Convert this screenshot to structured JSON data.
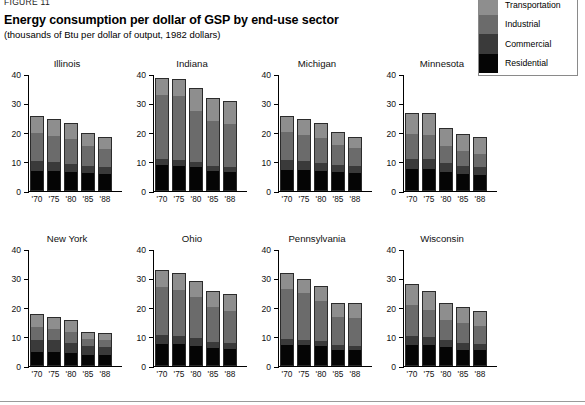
{
  "figure_label": "FIGURE 11",
  "title": "Energy consumption per dollar of GSP by end-use sector",
  "subtitle": "(thousands of Btu per dollar of output, 1982 dollars)",
  "legend": {
    "items": [
      {
        "label": "Transportation",
        "color": "#8e8e8e"
      },
      {
        "label": "Industrial",
        "color": "#6b6b6b"
      },
      {
        "label": "Commercial",
        "color": "#3a3a3a"
      },
      {
        "label": "Residential",
        "color": "#050505"
      }
    ]
  },
  "axis": {
    "yticks": [
      0,
      10,
      20,
      30,
      40
    ],
    "ymax": 40,
    "xlabels": [
      "'70",
      "'75",
      "'80",
      "'85",
      "'88"
    ]
  },
  "chart_data": {
    "type": "bar",
    "subtype": "stacked-bar-small-multiples",
    "title": "Energy consumption per dollar of GSP by end-use sector",
    "subtitle": "(thousands of Btu per dollar of output, 1982 dollars)",
    "xlabel": "",
    "ylabel": "thousands of Btu per dollar of output, 1982 dollars",
    "ylim": [
      0,
      40
    ],
    "grid": false,
    "legend_position": "top-right",
    "categories": [
      "'70",
      "'75",
      "'80",
      "'85",
      "'88"
    ],
    "series_names": [
      "Residential",
      "Commercial",
      "Industrial",
      "Transportation"
    ],
    "panels": [
      {
        "name": "Illinois",
        "series": [
          {
            "name": "Residential",
            "values": [
              6.5,
              6.4,
              6.2,
              5.7,
              5.5
            ]
          },
          {
            "name": "Commercial",
            "values": [
              3.3,
              3.1,
              2.8,
              2.5,
              2.3
            ]
          },
          {
            "name": "Industrial",
            "values": [
              9.8,
              9.1,
              8.4,
              6.8,
              6.2
            ]
          },
          {
            "name": "Transportation",
            "values": [
              5.4,
              5.4,
              5.1,
              4.2,
              3.8
            ]
          }
        ],
        "totals": [
          25.0,
          24.0,
          22.5,
          19.2,
          17.8
        ]
      },
      {
        "name": "Indiana",
        "series": [
          {
            "name": "Residential",
            "values": [
              8.5,
              8.3,
              7.8,
              6.5,
              6.3
            ]
          },
          {
            "name": "Commercial",
            "values": [
              2.2,
              2.1,
              1.8,
              1.6,
              1.6
            ]
          },
          {
            "name": "Industrial",
            "values": [
              21.8,
              21.6,
              17.4,
              15.4,
              14.6
            ]
          },
          {
            "name": "Transportation",
            "values": [
              5.5,
              5.5,
              7.5,
              7.5,
              7.5
            ]
          }
        ],
        "totals": [
          38.0,
          37.5,
          34.5,
          31.0,
          30.0
        ]
      },
      {
        "name": "Michigan",
        "series": [
          {
            "name": "Residential",
            "values": [
              7.0,
              6.9,
              6.6,
              6.0,
              5.8
            ]
          },
          {
            "name": "Commercial",
            "values": [
              3.2,
              3.0,
              2.7,
              2.4,
              2.3
            ]
          },
          {
            "name": "Industrial",
            "values": [
              9.6,
              9.0,
              8.4,
              7.0,
              6.2
            ]
          },
          {
            "name": "Transportation",
            "values": [
              5.2,
              5.1,
              5.0,
              4.0,
              3.6
            ]
          }
        ],
        "totals": [
          25.0,
          24.0,
          22.7,
          19.4,
          17.9
        ]
      },
      {
        "name": "Minnesota",
        "series": [
          {
            "name": "Residential",
            "values": [
              7.3,
              7.2,
              6.3,
              5.6,
              5.3
            ]
          },
          {
            "name": "Commercial",
            "values": [
              3.4,
              3.3,
              2.9,
              2.6,
              2.4
            ]
          },
          {
            "name": "Industrial",
            "values": [
              8.4,
              8.4,
              5.8,
              5.0,
              4.6
            ]
          },
          {
            "name": "Transportation",
            "values": [
              6.9,
              7.1,
              6.0,
              5.6,
              5.5
            ]
          }
        ],
        "totals": [
          26.0,
          26.0,
          21.0,
          18.8,
          17.8
        ]
      },
      {
        "name": "New York",
        "series": [
          {
            "name": "Residential",
            "values": [
              4.6,
              4.5,
              4.1,
              3.4,
              3.3
            ]
          },
          {
            "name": "Commercial",
            "values": [
              4.0,
              3.9,
              3.6,
              3.1,
              3.0
            ]
          },
          {
            "name": "Industrial",
            "values": [
              4.4,
              3.9,
              3.6,
              2.4,
              2.1
            ]
          },
          {
            "name": "Transportation",
            "values": [
              4.2,
              3.8,
              3.7,
              2.2,
              2.1
            ]
          }
        ],
        "totals": [
          17.2,
          16.1,
          15.0,
          11.1,
          10.5
        ]
      },
      {
        "name": "Ohio",
        "series": [
          {
            "name": "Residential",
            "values": [
              7.2,
              7.1,
              6.6,
              5.7,
              5.5
            ]
          },
          {
            "name": "Commercial",
            "values": [
              2.9,
              2.8,
              2.5,
              2.2,
              2.1
            ]
          },
          {
            "name": "Industrial",
            "values": [
              16.7,
              15.8,
              14.2,
              11.9,
              11.0
            ]
          },
          {
            "name": "Transportation",
            "values": [
              5.4,
              5.4,
              5.0,
              5.0,
              5.2
            ]
          }
        ],
        "totals": [
          32.2,
          31.1,
          28.3,
          24.8,
          23.8
        ]
      },
      {
        "name": "Pennsylvania",
        "series": [
          {
            "name": "Residential",
            "values": [
              7.0,
              6.8,
              6.4,
              5.3,
              5.2
            ]
          },
          {
            "name": "Commercial",
            "values": [
              1.9,
              1.8,
              1.7,
              1.4,
              1.4
            ]
          },
          {
            "name": "Industrial",
            "values": [
              17.2,
              15.9,
              13.8,
              9.8,
              9.5
            ]
          },
          {
            "name": "Transportation",
            "values": [
              5.1,
              4.5,
              4.8,
              4.5,
              4.8
            ]
          }
        ],
        "totals": [
          31.2,
          29.0,
          26.7,
          21.0,
          20.9
        ]
      },
      {
        "name": "Wisconsin",
        "series": [
          {
            "name": "Residential",
            "values": [
              6.9,
              6.8,
              6.1,
              5.3,
              5.1
            ]
          },
          {
            "name": "Commercial",
            "values": [
              2.9,
              2.7,
              2.4,
              2.1,
              2.0
            ]
          },
          {
            "name": "Industrial",
            "values": [
              10.7,
              9.3,
              7.0,
              7.0,
              6.3
            ]
          },
          {
            "name": "Transportation",
            "values": [
              7.0,
              6.2,
              5.5,
              5.1,
              4.6
            ]
          }
        ],
        "totals": [
          27.5,
          25.0,
          21.0,
          19.5,
          18.0
        ]
      }
    ]
  }
}
